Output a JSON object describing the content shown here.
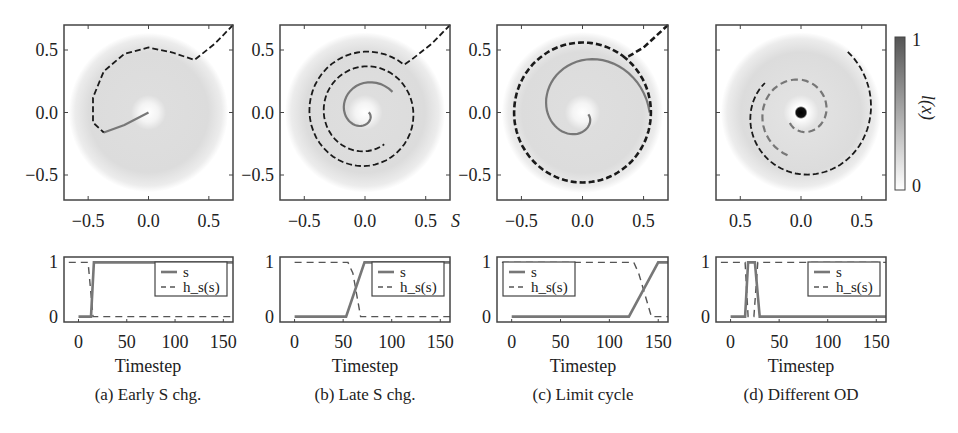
{
  "figure": {
    "colorbar": {
      "label": "l(x)",
      "min_label": "0",
      "max_label": "1",
      "color_low": "#ffffff",
      "color_high": "#555555"
    },
    "colors": {
      "traj_dark": "#1a1a1a",
      "traj_light": "#777777",
      "field": "#dcdcdc",
      "axis": "#444444",
      "line_s": "#777777",
      "line_h": "#555555"
    }
  },
  "panels": [
    {
      "id": "a",
      "caption": "(a) Early S chg.",
      "xlabel": "Timestep",
      "phase_xlabel_suffix": ""
    },
    {
      "id": "b",
      "caption": "(b) Late S chg.",
      "xlabel": "Timestep",
      "phase_xlabel_suffix": "S"
    },
    {
      "id": "c",
      "caption": "(c) Limit cycle",
      "xlabel": "Timestep",
      "phase_xlabel_suffix": ""
    },
    {
      "id": "d",
      "caption": "(d) Different OD",
      "xlabel": "Timestep",
      "phase_xlabel_suffix": ""
    }
  ],
  "chart_data": [
    {
      "type": "scatter",
      "title": "(a) Early S chg. - phase plot",
      "xlim": [
        -0.7,
        0.7
      ],
      "ylim": [
        -0.7,
        0.7
      ],
      "xticks": [
        "-0.5",
        "0.0",
        "0.5"
      ],
      "yticks": [
        "0.5",
        "0.0",
        "-0.5"
      ],
      "description": "Trajectory enters from top-right, curls counter-clockwise once (radius ~0.5) and ends near origin",
      "trajectory": [
        [
          0.7,
          0.7
        ],
        [
          0.55,
          0.55
        ],
        [
          0.38,
          0.42
        ],
        [
          0.2,
          0.48
        ],
        [
          0.0,
          0.52
        ],
        [
          -0.2,
          0.47
        ],
        [
          -0.37,
          0.33
        ],
        [
          -0.46,
          0.12
        ],
        [
          -0.46,
          -0.08
        ],
        [
          -0.37,
          -0.16
        ],
        [
          -0.2,
          -0.1
        ],
        [
          0.0,
          0.0
        ]
      ]
    },
    {
      "type": "scatter",
      "title": "(b) Late S chg. - phase plot",
      "xlim": [
        -0.7,
        0.7
      ],
      "ylim": [
        -0.7,
        0.7
      ],
      "xticks": [
        "-0.5",
        "0.0",
        "0.5"
      ],
      "yticks": [
        "0.5",
        "0.0",
        "-0.5"
      ],
      "description": "Trajectory spirals inward ~2.5 turns ending near origin"
    },
    {
      "type": "scatter",
      "title": "(c) Limit cycle - phase plot",
      "xlim": [
        -0.7,
        0.7
      ],
      "ylim": [
        -0.7,
        0.7
      ],
      "xticks": [
        "-0.5",
        "0.0",
        "0.5"
      ],
      "yticks": [
        "0.5",
        "0.0",
        "-0.5"
      ],
      "description": "Trajectory settles on a limit cycle of radius ~0.56, then spirals to origin"
    },
    {
      "type": "scatter",
      "title": "(d) Different OD - phase plot",
      "xlim": [
        -0.7,
        0.7
      ],
      "ylim": [
        -0.7,
        0.7
      ],
      "xticks": [
        "0.5",
        "0.0",
        "0.5"
      ],
      "yticks": [],
      "description": "Trajectory spirals from right edge inward to dark attractor at origin"
    },
    {
      "type": "line",
      "title": "(a) Early S chg. - time series",
      "xlabel": "Timestep",
      "xlim": [
        -15,
        160
      ],
      "ylim": [
        -0.1,
        1.1
      ],
      "xticks": [
        0,
        50,
        100,
        150
      ],
      "yticks": [
        0,
        1
      ],
      "legend": [
        "s",
        "h_s(s)"
      ],
      "legend_position": "upper right",
      "series": [
        {
          "name": "s",
          "x": [
            0,
            13,
            16,
            160
          ],
          "y": [
            0,
            0,
            1,
            1
          ]
        },
        {
          "name": "h_s(s)",
          "x": [
            -10,
            10,
            15,
            160
          ],
          "y": [
            1,
            1,
            0,
            0
          ]
        }
      ]
    },
    {
      "type": "line",
      "title": "(b) Late S chg. - time series",
      "xlabel": "Timestep",
      "xlim": [
        -15,
        160
      ],
      "ylim": [
        -0.1,
        1.1
      ],
      "xticks": [
        0,
        50,
        100,
        150
      ],
      "yticks": [
        0,
        1
      ],
      "legend": [
        "s",
        "h_s(s)"
      ],
      "legend_position": "upper right",
      "series": [
        {
          "name": "s",
          "x": [
            0,
            53,
            72,
            160
          ],
          "y": [
            0,
            0,
            1,
            1
          ]
        },
        {
          "name": "h_s(s)",
          "x": [
            0,
            55,
            60,
            68,
            160
          ],
          "y": [
            1,
            1,
            0.8,
            0,
            0
          ]
        }
      ]
    },
    {
      "type": "line",
      "title": "(c) Limit cycle - time series",
      "xlabel": "Timestep",
      "xlim": [
        -15,
        160
      ],
      "ylim": [
        -0.1,
        1.1
      ],
      "xticks": [
        0,
        50,
        100,
        150
      ],
      "yticks": [
        0,
        1
      ],
      "legend": [
        "s",
        "h_s(s)"
      ],
      "legend_position": "upper left",
      "series": [
        {
          "name": "s",
          "x": [
            0,
            120,
            150,
            160
          ],
          "y": [
            0,
            0,
            1,
            1
          ]
        },
        {
          "name": "h_s(s)",
          "x": [
            -10,
            125,
            130,
            143,
            160
          ],
          "y": [
            1,
            1,
            0.8,
            0,
            0
          ]
        }
      ]
    },
    {
      "type": "line",
      "title": "(d) Different OD - time series",
      "xlabel": "Timestep",
      "xlim": [
        -15,
        160
      ],
      "ylim": [
        -0.1,
        1.1
      ],
      "xticks": [
        0,
        50,
        100,
        150
      ],
      "yticks": [
        0,
        1
      ],
      "legend": [
        "s",
        "h_s(s)"
      ],
      "legend_position": "upper right",
      "series": [
        {
          "name": "s",
          "x": [
            0,
            15,
            18,
            25,
            30,
            160
          ],
          "y": [
            0,
            0,
            1,
            1,
            0,
            0
          ]
        },
        {
          "name": "h_s(s)",
          "x": [
            -10,
            15,
            18,
            24,
            28,
            160
          ],
          "y": [
            1,
            1,
            0,
            0,
            1,
            1
          ]
        }
      ]
    }
  ]
}
